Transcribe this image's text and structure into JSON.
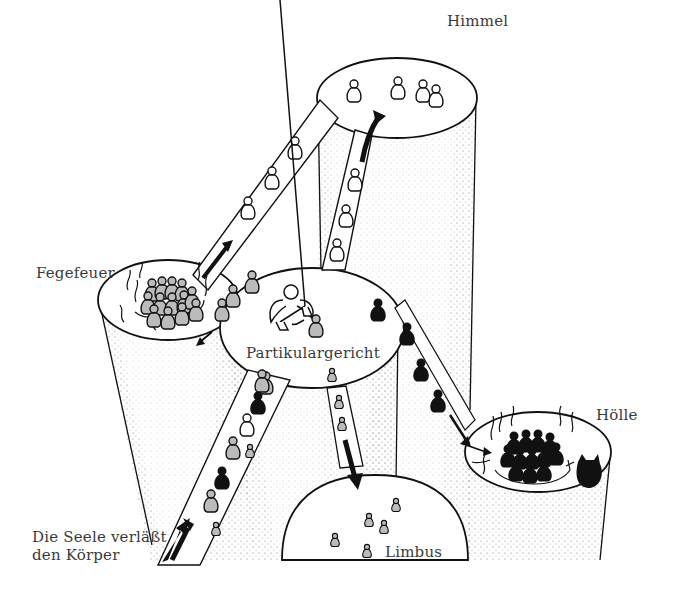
{
  "diagram": {
    "title": "",
    "colors": {
      "outline": "#111111",
      "stipple": "#9a9a9a",
      "soul_grey": "#b9b9b9",
      "soul_black": "#111111",
      "soul_white": "#ffffff",
      "background": "#ffffff"
    },
    "nodes": [
      {
        "id": "himmel",
        "label": "Himmel",
        "soul_type": "white",
        "soul_count": 4
      },
      {
        "id": "fegefeuer",
        "label": "Fegefeuer",
        "soul_type": "grey",
        "flames": true
      },
      {
        "id": "partikulargericht",
        "label": "Partikulargericht",
        "figure": "angel-with-scales"
      },
      {
        "id": "hoelle",
        "label": "Hölle",
        "soul_type": "black",
        "flames": true,
        "figure": "devil"
      },
      {
        "id": "limbus",
        "label": "Limbus",
        "soul_type": "small-grey",
        "soul_count": 5
      },
      {
        "id": "start",
        "label_lines": [
          "Die Seele verläßt",
          "den Körper"
        ]
      }
    ],
    "edges": [
      {
        "from": "start",
        "to": "partikulargericht",
        "souls": [
          "grey-small",
          "grey",
          "black",
          "grey",
          "grey-small",
          "white",
          "black",
          "grey"
        ]
      },
      {
        "from": "partikulargericht",
        "to": "himmel",
        "souls": [
          "white",
          "white",
          "white"
        ]
      },
      {
        "from": "fegefeuer",
        "to": "himmel",
        "souls": [
          "white",
          "white",
          "white"
        ]
      },
      {
        "from": "partikulargericht",
        "to": "fegefeuer",
        "souls": [
          "grey",
          "grey",
          "grey"
        ]
      },
      {
        "from": "partikulargericht",
        "to": "hoelle",
        "souls": [
          "black",
          "black",
          "black",
          "black"
        ]
      },
      {
        "from": "partikulargericht",
        "to": "limbus",
        "souls": [
          "small-grey",
          "small-grey"
        ]
      }
    ]
  },
  "labels": {
    "himmel": "Himmel",
    "fegefeuer": "Fegefeuer",
    "partikulargericht": "Partikulargericht",
    "hoelle": "Hölle",
    "limbus": "Limbus",
    "start_line1": "Die Seele verläßt",
    "start_line2": "den Körper"
  }
}
